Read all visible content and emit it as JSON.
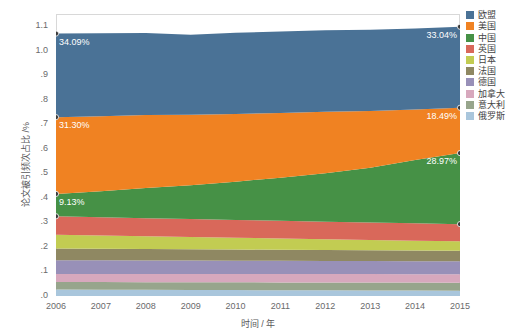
{
  "chart_data": {
    "type": "area",
    "stacked": true,
    "title": "",
    "xlabel": "时间 / 年",
    "ylabel": "论文被引频次占比 /%",
    "x": [
      2006,
      2007,
      2008,
      2009,
      2010,
      2011,
      2012,
      2013,
      2014,
      2015
    ],
    "categories": [
      "2006",
      "2007",
      "2008",
      "2009",
      "2010",
      "2011",
      "2012",
      "2013",
      "2014",
      "2015"
    ],
    "xlim": [
      2006,
      2015
    ],
    "ylim": [
      0.0,
      1.15
    ],
    "yticks": [
      ".0",
      ".1",
      ".2",
      ".3",
      ".4",
      ".5",
      ".6",
      ".7",
      ".8",
      ".9",
      "1.0",
      "1.1"
    ],
    "ytick_values": [
      0.0,
      0.1,
      0.2,
      0.3,
      0.4,
      0.5,
      0.6,
      0.7,
      0.8,
      0.9,
      1.0,
      1.1
    ],
    "grid": false,
    "legend_position": "right",
    "series": [
      {
        "name": "欧盟",
        "color": "#4a7296",
        "values": [
          0.3409,
          0.338,
          0.334,
          0.327,
          0.331,
          0.3325,
          0.333,
          0.3315,
          0.331,
          0.3304
        ]
      },
      {
        "name": "美国",
        "color": "#f08222",
        "values": [
          0.313,
          0.306,
          0.298,
          0.287,
          0.276,
          0.264,
          0.25,
          0.231,
          0.206,
          0.1849
        ]
      },
      {
        "name": "中国",
        "color": "#469146",
        "values": [
          0.0913,
          0.106,
          0.123,
          0.138,
          0.156,
          0.176,
          0.198,
          0.224,
          0.258,
          0.2897
        ]
      },
      {
        "name": "英国",
        "color": "#d9685a",
        "values": [
          0.075,
          0.0745,
          0.0735,
          0.073,
          0.0725,
          0.072,
          0.0715,
          0.071,
          0.0705,
          0.07
        ]
      },
      {
        "name": "日本",
        "color": "#c2cc52",
        "values": [
          0.056,
          0.054,
          0.052,
          0.05,
          0.048,
          0.046,
          0.044,
          0.042,
          0.0405,
          0.039
        ]
      },
      {
        "name": "法国",
        "color": "#8f8862",
        "values": [
          0.048,
          0.0475,
          0.0468,
          0.0462,
          0.0456,
          0.045,
          0.0444,
          0.0438,
          0.0432,
          0.0426
        ]
      },
      {
        "name": "德国",
        "color": "#9890b8",
        "values": [
          0.056,
          0.0556,
          0.0552,
          0.0548,
          0.0544,
          0.054,
          0.0536,
          0.0532,
          0.0528,
          0.0524
        ]
      },
      {
        "name": "加拿大",
        "color": "#d7a8bd",
        "values": [
          0.033,
          0.0332,
          0.0334,
          0.0336,
          0.0338,
          0.034,
          0.0342,
          0.0344,
          0.0346,
          0.0348
        ]
      },
      {
        "name": "意大利",
        "color": "#97a58c",
        "values": [
          0.031,
          0.0312,
          0.0314,
          0.0316,
          0.0318,
          0.032,
          0.0322,
          0.0324,
          0.0326,
          0.0328
        ]
      },
      {
        "name": "俄罗斯",
        "color": "#a9c6dc",
        "values": [
          0.026,
          0.0255,
          0.025,
          0.0245,
          0.024,
          0.0235,
          0.023,
          0.0225,
          0.022,
          0.0215
        ]
      }
    ],
    "annotations": [
      {
        "text": "34.09%",
        "series": "欧盟",
        "x": 2006,
        "anchor": "start"
      },
      {
        "text": "33.04%",
        "series": "欧盟",
        "x": 2015,
        "anchor": "end"
      },
      {
        "text": "31.30%",
        "series": "美国",
        "x": 2006,
        "anchor": "start"
      },
      {
        "text": "18.49%",
        "series": "美国",
        "x": 2015,
        "anchor": "end"
      },
      {
        "text": "9.13%",
        "series": "中国",
        "x": 2006,
        "anchor": "start"
      },
      {
        "text": "28.97%",
        "series": "中国",
        "x": 2015,
        "anchor": "end"
      }
    ]
  },
  "legend": {
    "items": [
      {
        "label": "欧盟"
      },
      {
        "label": "美国"
      },
      {
        "label": "中国"
      },
      {
        "label": "英国"
      },
      {
        "label": "日本"
      },
      {
        "label": "法国"
      },
      {
        "label": "德国"
      },
      {
        "label": "加拿大"
      },
      {
        "label": "意大利"
      },
      {
        "label": "俄罗斯"
      }
    ]
  }
}
